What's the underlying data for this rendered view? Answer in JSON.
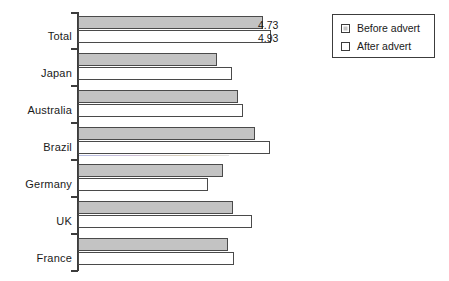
{
  "chart_data": {
    "type": "bar",
    "orientation": "horizontal",
    "title": "",
    "xlabel": "",
    "ylabel": "",
    "grid": false,
    "legend_position": "top-right",
    "categories": [
      "Total",
      "Japan",
      "Australia",
      "Brazil",
      "Germany",
      "UK",
      "France"
    ],
    "series": [
      {
        "name": "Before advert",
        "color": "#c3c3c3",
        "values": [
          4.73,
          3.55,
          4.1,
          4.53,
          3.72,
          3.98,
          3.85
        ]
      },
      {
        "name": "After advert",
        "color": "#ffffff",
        "values": [
          4.93,
          3.95,
          4.23,
          4.92,
          3.32,
          4.45,
          4.0
        ]
      }
    ],
    "data_labels": [
      {
        "category": "Total",
        "series": "Before advert",
        "text": "4.73"
      },
      {
        "category": "Total",
        "series": "After advert",
        "text": "4.93"
      }
    ],
    "xlim": [
      0,
      5.3
    ]
  },
  "legend": {
    "items": [
      {
        "label": "Before advert",
        "swatch": "gray-filled-square"
      },
      {
        "label": "After advert",
        "swatch": "white-empty-square"
      }
    ]
  },
  "axis": {
    "tick_count": 8
  }
}
